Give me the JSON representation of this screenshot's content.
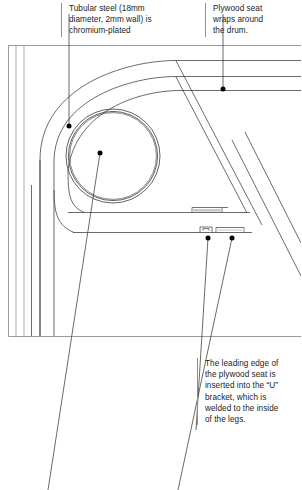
{
  "figure": {
    "type": "technical-line-drawing",
    "background_color": "#ffffff",
    "line_color": "#3a3a3a",
    "frame_color": "#9a9a9a",
    "leader_color": "#3a3a3a",
    "dot_color": "#000000"
  },
  "callouts": [
    {
      "id": "tubular-steel",
      "text": "Tubular steel (18mm diameter, 2mm wall) is chromium-plated",
      "lines": [
        "Tubular steel (18mm",
        "diameter, 2mm wall) is",
        "chromium-plated"
      ],
      "leader": {
        "from_x": 69,
        "from_y": 40,
        "to_x": 69,
        "to_y": 126
      },
      "dot": {
        "x": 69,
        "y": 126
      }
    },
    {
      "id": "plywood-seat",
      "text": "Plywood seat wraps around the drum.",
      "lines": [
        "Plywood seat",
        "wraps around",
        "the drum."
      ],
      "leader": {
        "from_x": 223,
        "from_y": 40,
        "to_x": 223,
        "to_y": 89
      },
      "dot": {
        "x": 223,
        "y": 89
      }
    },
    {
      "id": "leading-edge",
      "text": "The leading edge of the plywood seat is inserted into the “U” bracket, which is welded to the inside of the legs.",
      "lines": [
        "The leading edge of",
        "the plywood seat is",
        "inserted into the “U”",
        "bracket, which is",
        "welded to the inside",
        "of the legs."
      ],
      "leader": {
        "from_x": 208,
        "from_y": 238,
        "to_x": 196,
        "to_y": 430
      },
      "dot": {
        "x": 208,
        "y": 238
      }
    },
    {
      "id": "bracket-second",
      "text": "",
      "lines": [],
      "leader": {
        "from_x": 232,
        "from_y": 238,
        "to_x": 178,
        "to_y": 490
      },
      "dot": {
        "x": 232,
        "y": 238
      }
    },
    {
      "id": "drum-center",
      "text": "",
      "lines": [],
      "leader": {
        "from_x": 100,
        "from_y": 153,
        "to_x": 48,
        "to_y": 490
      },
      "dot": {
        "x": 100,
        "y": 153
      }
    }
  ],
  "bottom_partial": {
    "left_text": "",
    "right_text": ""
  },
  "geometry": {
    "frame": {
      "x": 8,
      "y": 45,
      "w": 293,
      "h": 291
    },
    "drum_outer_circle": {
      "cx": 113,
      "cy": 156,
      "r": 47
    },
    "drum_inner_circle": {
      "cx": 113,
      "cy": 156,
      "r": 44.5
    },
    "seat_wrap_radius": 72,
    "note": "Tube wall shown as two concentric circles 2mm apart"
  }
}
